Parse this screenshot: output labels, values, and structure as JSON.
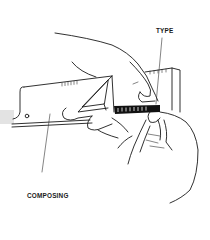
{
  "figure": {
    "labels": {
      "type": "TYPE",
      "composing_stick_line1": "COMPOSING",
      "composing_stick_line2": "STICK"
    },
    "colors": {
      "ink": "#1a1a1a",
      "background": "#ffffff",
      "type_block": "#111111",
      "edge_shadow": "#d6d6d6"
    }
  }
}
